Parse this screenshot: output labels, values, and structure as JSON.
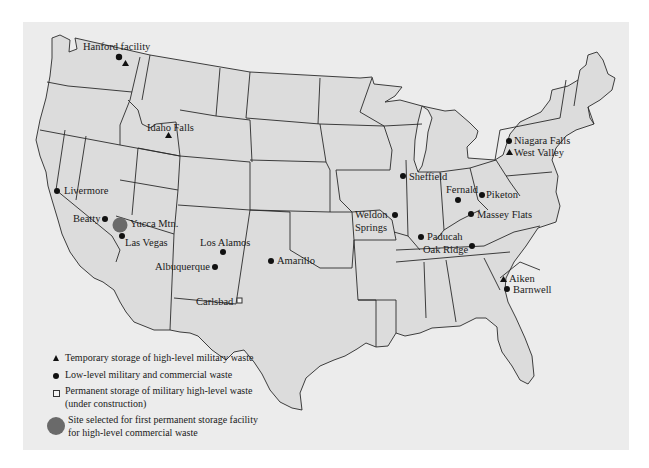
{
  "map": {
    "title": "Nuclear waste storage sites in the United States",
    "colors": {
      "panel": "#ececec",
      "land": "#dcdcdc",
      "marker": "#111111",
      "selected_site": "#6a6a6a"
    },
    "sites": [
      {
        "name": "Hanford facility",
        "symbols": [
          "circle",
          "triangle"
        ]
      },
      {
        "name": "Idaho Falls",
        "symbols": [
          "triangle"
        ]
      },
      {
        "name": "Livermore",
        "symbols": [
          "circle"
        ]
      },
      {
        "name": "Beatty",
        "symbols": [
          "circle"
        ]
      },
      {
        "name": "Yucca Mtn.",
        "symbols": [
          "large-circle"
        ]
      },
      {
        "name": "Las Vegas",
        "symbols": [
          "circle"
        ]
      },
      {
        "name": "Los Alamos",
        "symbols": [
          "circle"
        ]
      },
      {
        "name": "Albuquerque",
        "symbols": [
          "circle"
        ]
      },
      {
        "name": "Amarillo",
        "symbols": [
          "circle"
        ]
      },
      {
        "name": "Carlsbad",
        "symbols": [
          "square"
        ]
      },
      {
        "name": "Sheffield",
        "symbols": [
          "circle"
        ]
      },
      {
        "name": "Weldon",
        "symbols": [
          "circle"
        ]
      },
      {
        "name": "Springs",
        "symbols": []
      },
      {
        "name": "Paducah",
        "symbols": [
          "circle"
        ]
      },
      {
        "name": "Fernald",
        "symbols": [
          "circle"
        ]
      },
      {
        "name": "Piketon",
        "symbols": [
          "circle"
        ]
      },
      {
        "name": "Massey Flats",
        "symbols": [
          "circle"
        ]
      },
      {
        "name": "Oak Ridge",
        "symbols": [
          "circle"
        ]
      },
      {
        "name": "Niagara Falls",
        "symbols": [
          "circle"
        ]
      },
      {
        "name": "West Valley",
        "symbols": [
          "triangle"
        ]
      },
      {
        "name": "Aiken",
        "symbols": [
          "triangle"
        ]
      },
      {
        "name": "Barnwell",
        "symbols": [
          "circle"
        ]
      }
    ]
  },
  "legend": [
    {
      "symbol": "triangle",
      "text": "Temporary storage of high-level military waste"
    },
    {
      "symbol": "circle",
      "text": "Low-level military and commercial waste"
    },
    {
      "symbol": "square",
      "text": "Permanent storage of military high-level waste\n(under construction)"
    },
    {
      "symbol": "large-circle",
      "text": "Site selected for first permanent storage facility\nfor high-level commercial waste"
    }
  ]
}
